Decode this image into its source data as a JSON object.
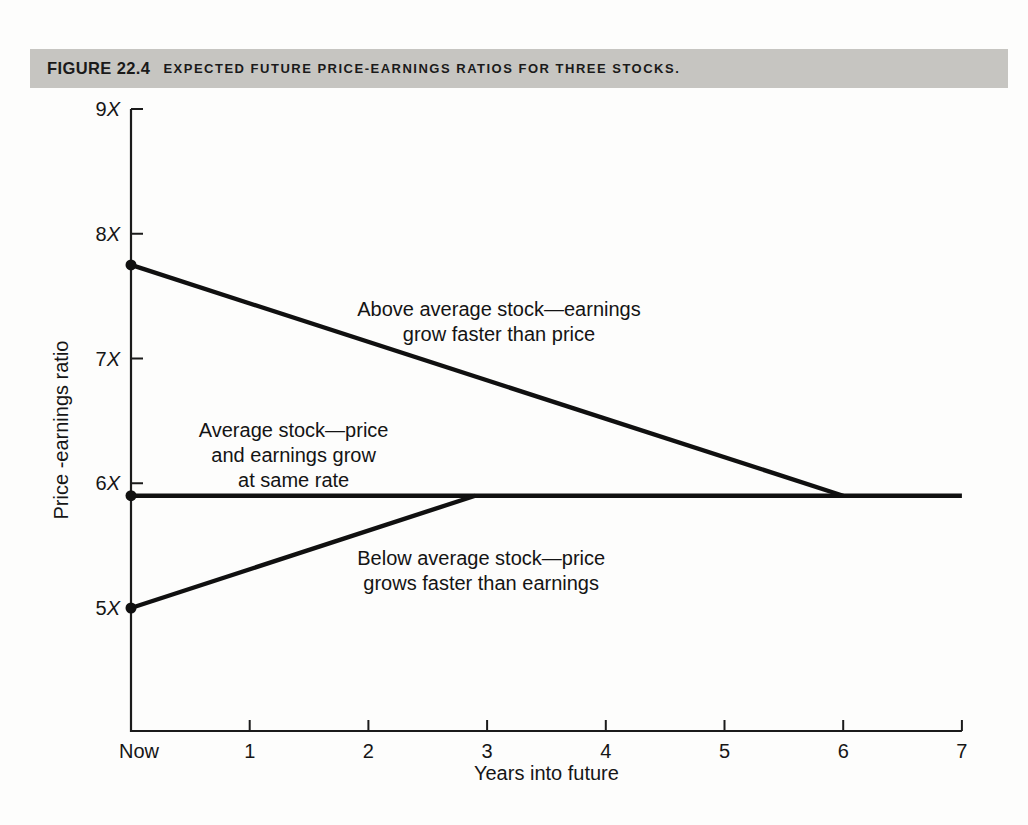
{
  "figure": {
    "label": "FIGURE 22.4",
    "title": "Expected future price-earnings ratios for three stocks.",
    "bar_color": "#c6c5c1",
    "text_color": "#1a1a1a"
  },
  "chart_data": {
    "type": "line",
    "title": "Expected future price-earnings ratios for three stocks",
    "xlabel": "Years into future",
    "ylabel": "Price -earnings ratio",
    "xlim": [
      0,
      7
    ],
    "ylim": [
      4,
      9
    ],
    "grid": false,
    "legend_position": "none (inline annotations)",
    "axis_color": "#1b1b1b",
    "line_color": "#101010",
    "x_ticks": [
      {
        "x": 0,
        "label": "Now",
        "tick": false
      },
      {
        "x": 1,
        "label": "1",
        "tick": true
      },
      {
        "x": 2,
        "label": "2",
        "tick": true
      },
      {
        "x": 3,
        "label": "3",
        "tick": true
      },
      {
        "x": 4,
        "label": "4",
        "tick": true
      },
      {
        "x": 5,
        "label": "5",
        "tick": true
      },
      {
        "x": 6,
        "label": "6",
        "tick": true
      },
      {
        "x": 7,
        "label": "7",
        "tick": true
      }
    ],
    "y_ticks": [
      {
        "v": 9,
        "label": "9X",
        "tick": true
      },
      {
        "v": 8,
        "label": "8X",
        "tick": true
      },
      {
        "v": 7,
        "label": "7X",
        "tick": true
      },
      {
        "v": 6,
        "label": "6X",
        "tick": true
      },
      {
        "v": 5,
        "label": "5X",
        "tick": false
      }
    ],
    "series": [
      {
        "name": "Above average stock",
        "points": [
          [
            0,
            7.75
          ],
          [
            6,
            5.9
          ]
        ],
        "start_dot": true,
        "annotation": {
          "lines": [
            "Above average stock—earnings",
            "grow faster than price"
          ],
          "x": 3.1,
          "y": 7.3
        }
      },
      {
        "name": "Average stock",
        "points": [
          [
            0,
            5.9
          ],
          [
            7,
            5.9
          ]
        ],
        "start_dot": true,
        "annotation": {
          "lines": [
            "Average stock—price",
            "and earnings grow",
            "at same rate"
          ],
          "x": 1.37,
          "y": 6.23
        }
      },
      {
        "name": "Below average stock",
        "points": [
          [
            0,
            5.0
          ],
          [
            2.9,
            5.9
          ]
        ],
        "start_dot": true,
        "annotation": {
          "lines": [
            "Below average stock—price",
            "grows faster than earnings"
          ],
          "x": 2.95,
          "y": 5.3
        }
      }
    ]
  }
}
